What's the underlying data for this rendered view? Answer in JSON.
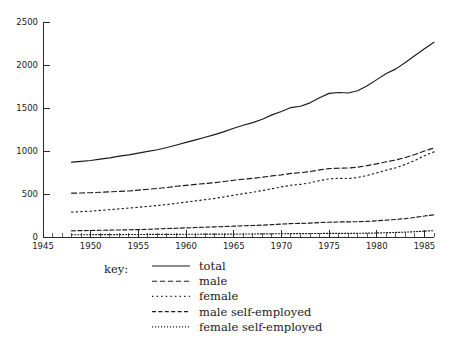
{
  "chart_data": {
    "type": "line",
    "title": "",
    "subtitle": "",
    "xlabel": "",
    "ylabel": "",
    "xlim": [
      1945,
      1986
    ],
    "ylim": [
      0,
      2500
    ],
    "grid": false,
    "legend_position": "below-plot",
    "legend_title": "key:",
    "xticks": [
      1945,
      1950,
      1955,
      1960,
      1965,
      1970,
      1975,
      1980,
      1985
    ],
    "xtick_labels": [
      "1945",
      "1950",
      "1955",
      "1960",
      "1965",
      "1970",
      "1975",
      "1980",
      "1985"
    ],
    "minor_xtick_interval": 1,
    "yticks": [
      0,
      500,
      1000,
      1500,
      2000,
      2500
    ],
    "ytick_labels": [
      "0",
      "500",
      "1000",
      "1500",
      "2000",
      "2500"
    ],
    "x": [
      1948,
      1949,
      1950,
      1951,
      1952,
      1953,
      1954,
      1955,
      1956,
      1957,
      1958,
      1959,
      1960,
      1961,
      1962,
      1963,
      1964,
      1965,
      1966,
      1967,
      1968,
      1969,
      1970,
      1971,
      1972,
      1973,
      1974,
      1975,
      1976,
      1977,
      1978,
      1979,
      1980,
      1981,
      1982,
      1983,
      1984,
      1985,
      1986
    ],
    "series": [
      {
        "name": "total",
        "dash": "solid",
        "values": [
          870,
          880,
          890,
          905,
          920,
          940,
          955,
          975,
          995,
          1015,
          1040,
          1070,
          1100,
          1130,
          1160,
          1190,
          1225,
          1265,
          1300,
          1330,
          1370,
          1420,
          1460,
          1505,
          1520,
          1560,
          1620,
          1670,
          1680,
          1675,
          1700,
          1760,
          1830,
          1900,
          1955,
          2030,
          2110,
          2190,
          2265
        ]
      },
      {
        "name": "male",
        "dash": "dashed",
        "values": [
          510,
          512,
          515,
          520,
          525,
          530,
          535,
          545,
          555,
          565,
          575,
          590,
          600,
          612,
          622,
          632,
          645,
          660,
          672,
          682,
          695,
          710,
          722,
          740,
          748,
          760,
          780,
          795,
          800,
          802,
          812,
          830,
          850,
          875,
          895,
          925,
          960,
          1000,
          1035
        ]
      },
      {
        "name": "female",
        "dash": "dotted",
        "values": [
          290,
          295,
          300,
          310,
          318,
          328,
          336,
          346,
          356,
          366,
          378,
          392,
          406,
          420,
          434,
          448,
          466,
          486,
          504,
          520,
          540,
          562,
          582,
          602,
          612,
          630,
          656,
          676,
          682,
          680,
          692,
          716,
          746,
          778,
          805,
          845,
          890,
          945,
          990
        ]
      },
      {
        "name": "male self-employed",
        "dash": "dashed-fine",
        "values": [
          72,
          74,
          76,
          78,
          80,
          82,
          84,
          86,
          90,
          94,
          98,
          102,
          106,
          110,
          114,
          118,
          122,
          126,
          130,
          134,
          138,
          144,
          150,
          156,
          158,
          162,
          168,
          172,
          175,
          176,
          178,
          182,
          188,
          196,
          204,
          214,
          228,
          244,
          258
        ]
      },
      {
        "name": "female self-employed",
        "dash": "dotted-fine",
        "values": [
          26,
          26,
          27,
          27,
          28,
          28,
          29,
          29,
          30,
          30,
          31,
          31,
          32,
          32,
          33,
          33,
          34,
          34,
          35,
          35,
          36,
          37,
          38,
          39,
          39,
          40,
          41,
          42,
          42,
          42,
          43,
          45,
          47,
          50,
          53,
          57,
          62,
          68,
          74
        ]
      }
    ]
  },
  "legend": {
    "title": "key:",
    "entries": [
      {
        "label": "total",
        "dash": "solid"
      },
      {
        "label": "male",
        "dash": "dashed"
      },
      {
        "label": "female",
        "dash": "dotted"
      },
      {
        "label": "male self-employed",
        "dash": "dashed-fine"
      },
      {
        "label": "female self-employed",
        "dash": "dotted-fine"
      }
    ]
  },
  "axes": {
    "x_labels": [
      "1945",
      "1950",
      "1955",
      "1960",
      "1965",
      "1970",
      "1975",
      "1980",
      "1985"
    ],
    "y_labels": [
      "0",
      "500",
      "1000",
      "1500",
      "2000",
      "2500"
    ]
  }
}
